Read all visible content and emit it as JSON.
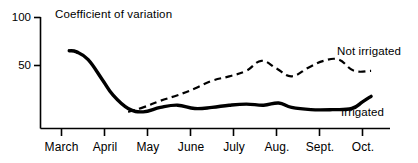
{
  "chart_data": {
    "type": "line",
    "title": "Coefficient of variation",
    "xlabel": "",
    "ylabel": "",
    "ylim": [
      0,
      100
    ],
    "yticks": [
      50,
      100
    ],
    "ytick_labels": [
      "50",
      "100"
    ],
    "grid": false,
    "legend_position": "inline-right",
    "categories": [
      "March",
      "April",
      "May",
      "June",
      "July",
      "Aug.",
      "Sept.",
      "Oct."
    ],
    "x": [
      0,
      1,
      2,
      3,
      4,
      5,
      6,
      7
    ],
    "series": [
      {
        "name": "Irrigated",
        "style": "solid",
        "color": "#000000",
        "x": [
          0.18,
          0.35,
          0.62,
          0.95,
          1.2,
          1.55,
          1.9,
          2.3,
          2.7,
          3.1,
          3.5,
          3.9,
          4.3,
          4.7,
          5.05,
          5.35,
          5.8,
          6.3,
          6.75,
          7.0,
          7.2
        ],
        "values": [
          70,
          69,
          62,
          44,
          30,
          18,
          15,
          19,
          21,
          18,
          19,
          21,
          22,
          21,
          23,
          19,
          17,
          17,
          18,
          24,
          29
        ]
      },
      {
        "name": "Not irrigated",
        "style": "dashed",
        "color": "#000000",
        "x": [
          1.55,
          1.9,
          2.3,
          2.7,
          3.1,
          3.5,
          3.9,
          4.3,
          4.65,
          5.0,
          5.35,
          5.75,
          6.1,
          6.45,
          6.8,
          7.2
        ],
        "values": [
          15,
          19,
          25,
          30,
          36,
          43,
          47,
          52,
          61,
          54,
          47,
          55,
          61,
          62,
          52,
          52
        ]
      }
    ],
    "annotations": [
      {
        "text": "Not irrigated",
        "x": 7.05,
        "y": 66
      },
      {
        "text": "Irrigated",
        "x": 7.2,
        "y": 13
      }
    ]
  },
  "axes": {
    "y_tick_top": "100",
    "y_tick_mid": "50"
  },
  "months": {
    "m1": "March",
    "m2": "April",
    "m3": "May",
    "m4": "June",
    "m5": "July",
    "m6": "Aug.",
    "m7": "Sept.",
    "m8": "Oct."
  },
  "legend": {
    "not_irrigated": "Not irrigated",
    "irrigated": "Irrigated"
  },
  "colors": {
    "ink": "#000000",
    "background": "#ffffff"
  }
}
